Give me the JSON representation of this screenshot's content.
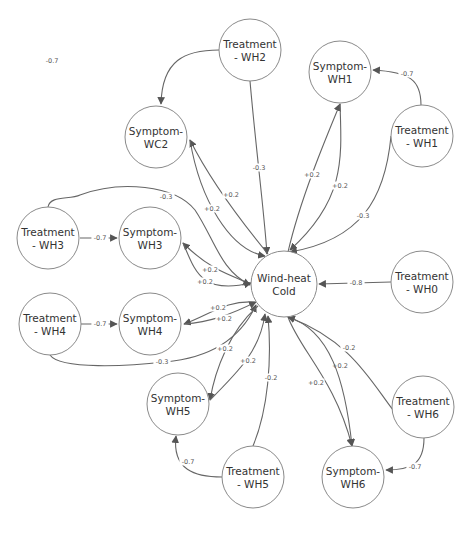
{
  "diagram": {
    "type": "directed-graph",
    "nodes": [
      {
        "id": "wh2t",
        "line1": "Treatment",
        "line2": "- WH2",
        "x": 250,
        "y": 50,
        "r": 31
      },
      {
        "id": "wh1s",
        "line1": "Symptom-",
        "line2": "WH1",
        "x": 340,
        "y": 72,
        "r": 31
      },
      {
        "id": "wh1t",
        "line1": "Treatment",
        "line2": "- WH1",
        "x": 422,
        "y": 136,
        "r": 31
      },
      {
        "id": "wc2s",
        "line1": "Symptom-",
        "line2": "WC2",
        "x": 156,
        "y": 137,
        "r": 31
      },
      {
        "id": "wh3t",
        "line1": "Treatment",
        "line2": "- WH3",
        "x": 48,
        "y": 238,
        "r": 31
      },
      {
        "id": "wh3s",
        "line1": "Symptom-",
        "line2": "WH3",
        "x": 150,
        "y": 238,
        "r": 31
      },
      {
        "id": "whc",
        "line1": "Wind-heat",
        "line2": "Cold",
        "x": 284,
        "y": 284,
        "r": 33
      },
      {
        "id": "wh0t",
        "line1": "Treatment",
        "line2": "- WH0",
        "x": 422,
        "y": 282,
        "r": 31
      },
      {
        "id": "wh4t",
        "line1": "Treatment",
        "line2": "- WH4",
        "x": 50,
        "y": 324,
        "r": 31
      },
      {
        "id": "wh4s",
        "line1": "Symptom-",
        "line2": "WH4",
        "x": 150,
        "y": 324,
        "r": 31
      },
      {
        "id": "wh5s",
        "line1": "Symptom-",
        "line2": "WH5",
        "x": 178,
        "y": 404,
        "r": 31
      },
      {
        "id": "wh5t",
        "line1": "Treatment",
        "line2": "- WH5",
        "x": 253,
        "y": 477,
        "r": 31
      },
      {
        "id": "wh6t",
        "line1": "Treatment",
        "line2": "- WH6",
        "x": 423,
        "y": 407,
        "r": 31
      },
      {
        "id": "wh6s",
        "line1": "Symptom-",
        "line2": "WH6",
        "x": 353,
        "y": 477,
        "r": 31
      }
    ],
    "edges": [
      {
        "from": "Treatment - WH2",
        "to": "Symptom-WC2",
        "weight": "-0.7",
        "d": "M219,50 C185,50 162,60 161,104",
        "lx": 52,
        "ly": 61
      },
      {
        "from": "Treatment - WH2",
        "to": "Wind-heat Cold",
        "weight": "-0.3",
        "d": "M250,81 C256,150 264,210 267,254",
        "lx": 259,
        "ly": 168
      },
      {
        "from": "Treatment - WH1",
        "to": "Symptom-WH1",
        "weight": "-0.7",
        "d": "M421,105 C421,80 410,72 373,70",
        "lx": 407,
        "ly": 74
      },
      {
        "from": "Treatment - WH1",
        "to": "Wind-heat Cold",
        "weight": "-0.3",
        "d": "M391,136 C385,200 360,240 290,252",
        "lx": 363,
        "ly": 216
      },
      {
        "from": "Wind-heat Cold",
        "to": "Symptom-WH1",
        "weight": "+0.2",
        "d": "M288,252 C300,200 325,140 340,104",
        "lx": 312,
        "ly": 175
      },
      {
        "from": "Symptom-WH1",
        "to": "Wind-heat Cold",
        "weight": "+0.2",
        "d": "M340,104 C342,160 345,200 290,250",
        "lx": 340,
        "ly": 186
      },
      {
        "from": "Wind-heat Cold",
        "to": "Symptom-WC2",
        "weight": "+0.2",
        "d": "M268,254 C240,220 210,180 190,140",
        "lx": 231,
        "ly": 195
      },
      {
        "from": "Symptom-WC2",
        "to": "Wind-heat Cold",
        "weight": "+0.2",
        "d": "M190,140 C200,200 230,250 265,256",
        "lx": 212,
        "ly": 209
      },
      {
        "from": "Treatment - WH3",
        "to": "Wind-heat Cold",
        "weight": "-0.3",
        "d": "M48,207 C50,195 70,200 80,195 C120,180 175,185 195,210 C215,240 220,270 250,285",
        "lx": 166,
        "ly": 197
      },
      {
        "from": "Treatment - WH3",
        "to": "Symptom-WH3",
        "weight": "-0.7",
        "d": "M80,238 L117,238",
        "lx": 100,
        "ly": 238
      },
      {
        "from": "Wind-heat Cold",
        "to": "Symptom-WH3",
        "weight": "+0.2",
        "d": "M251,284 C230,275 210,270 183,243",
        "lx": 210,
        "ly": 270
      },
      {
        "from": "Symptom-WH3",
        "to": "Wind-heat Cold",
        "weight": "+0.2",
        "d": "M183,243 C195,270 200,295 251,283",
        "lx": 205,
        "ly": 282
      },
      {
        "from": "Treatment - WH0",
        "to": "Wind-heat Cold",
        "weight": "-0.8",
        "d": "M391,282 L319,284",
        "lx": 356,
        "ly": 283
      },
      {
        "from": "Treatment - WH4",
        "to": "Symptom-WH4",
        "weight": "-0.7",
        "d": "M81,324 L117,324",
        "lx": 100,
        "ly": 324
      },
      {
        "from": "Wind-heat Cold",
        "to": "Symptom-WH4",
        "weight": "+0.2",
        "d": "M255,302 C225,300 210,315 184,324",
        "lx": 218,
        "ly": 308
      },
      {
        "from": "Symptom-WH4",
        "to": "Wind-heat Cold",
        "weight": "+0.2",
        "d": "M184,324 C210,322 230,315 256,302",
        "lx": 224,
        "ly": 319
      },
      {
        "from": "Treatment - WH4",
        "to": "Wind-heat Cold",
        "weight": "-0.3",
        "d": "M50,355 C60,370 130,366 165,362 C210,358 240,340 256,305",
        "lx": 162,
        "ly": 362
      },
      {
        "from": "Wind-heat Cold",
        "to": "Symptom-WH5",
        "weight": "+0.2",
        "d": "M258,306 C230,330 215,370 210,400",
        "lx": 225,
        "ly": 349
      },
      {
        "from": "Symptom-WH5",
        "to": "Wind-heat Cold",
        "weight": "+0.2",
        "d": "M210,400 C240,370 260,350 265,314",
        "lx": 248,
        "ly": 361
      },
      {
        "from": "Treatment - WH5",
        "to": "Wind-heat Cold",
        "weight": "-0.2",
        "d": "M253,446 C268,410 272,360 268,316",
        "lx": 271,
        "ly": 378
      },
      {
        "from": "Treatment - WH5",
        "to": "Symptom-WH5",
        "weight": "-0.7",
        "d": "M222,477 C195,477 172,470 176,436",
        "lx": 188,
        "ly": 462
      },
      {
        "from": "Wind-heat Cold",
        "to": "Symptom-WH6",
        "weight": "+0.2",
        "d": "M288,317 C300,350 335,380 352,446",
        "lx": 340,
        "ly": 366
      },
      {
        "from": "Wind-heat Cold",
        "to": "Symptom-WH6",
        "weight": "+0.2",
        "d": "M288,317 C330,330 345,380 352,446",
        "lx": 316,
        "ly": 383
      },
      {
        "from": "Treatment - WH6",
        "to": "Wind-heat Cold",
        "weight": "-0.2",
        "d": "M393,410 C370,380 350,340 288,317",
        "lx": 349,
        "ly": 348
      },
      {
        "from": "Treatment - WH6",
        "to": "Symptom-WH6",
        "weight": "-0.7",
        "d": "M424,438 C424,465 410,470 386,470",
        "lx": 415,
        "ly": 467
      }
    ]
  }
}
